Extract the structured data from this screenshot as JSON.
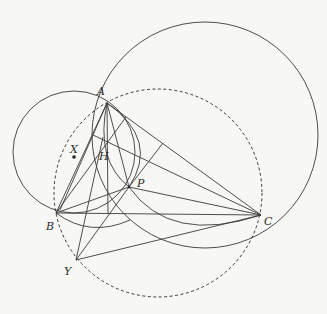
{
  "diagram": {
    "type": "geometry",
    "points": {
      "A": {
        "label": "A",
        "x": 107,
        "y": 103
      },
      "B": {
        "label": "B",
        "x": 56,
        "y": 213
      },
      "C": {
        "label": "C",
        "x": 261,
        "y": 215
      },
      "H": {
        "label": "H",
        "x": 108,
        "y": 139
      },
      "P": {
        "label": "P",
        "x": 129,
        "y": 187
      },
      "X": {
        "label": "X",
        "x": 74,
        "y": 157
      },
      "Y": {
        "label": "Y",
        "x": 76,
        "y": 260
      }
    },
    "circles": [
      {
        "name": "big-circle",
        "cx": 205,
        "cy": 135,
        "r": 113,
        "style": "solid"
      },
      {
        "name": "circumcircle",
        "cx": 158,
        "cy": 193,
        "r": 104,
        "style": "dashed"
      },
      {
        "name": "circle-x",
        "cx": 74,
        "cy": 152,
        "r": 61,
        "style": "solid"
      }
    ]
  }
}
